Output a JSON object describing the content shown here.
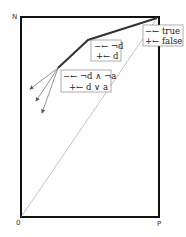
{
  "diagram": {
    "corner_labels": {
      "top_left": "N",
      "bottom_left": "0",
      "bottom_right": "P"
    },
    "boxes": [
      {
        "id": "box-true-false",
        "line1": "−← true",
        "line2": "+← false"
      },
      {
        "id": "box-not-d",
        "line1": "−← ¬d",
        "line2": "+← d"
      },
      {
        "id": "box-conj",
        "line1": "−← ¬d ∧ ¬a",
        "line2": "+← d ∨ a"
      }
    ],
    "colors": {
      "frame": "#111111",
      "thick_path": "#333333",
      "thin_lines": "#888888"
    }
  }
}
